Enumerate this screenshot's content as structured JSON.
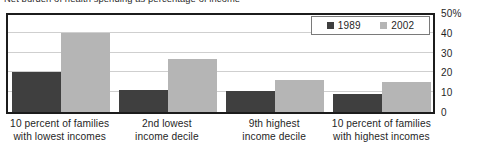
{
  "chart_data": {
    "type": "bar",
    "title": "Net burden of health spending as percentage of income",
    "xlabel": "",
    "ylabel": "",
    "ylim": [
      0,
      50
    ],
    "yticks": [
      0,
      10,
      20,
      30,
      40,
      50
    ],
    "ytick_labels": [
      "0",
      "10",
      "20",
      "30",
      "40",
      "50%"
    ],
    "grid": true,
    "legend_position": "top-right",
    "categories": [
      "10 percent of families with lowest incomes",
      "2nd lowest income decile",
      "9th highest income decile",
      "10 percent of families with highest incomes"
    ],
    "category_lines": [
      [
        "10 percent of families",
        "with lowest incomes"
      ],
      [
        "2nd lowest",
        "income decile"
      ],
      [
        "9th highest",
        "income decile"
      ],
      [
        "10 percent of families",
        "with highest incomes"
      ]
    ],
    "series": [
      {
        "name": "1989",
        "color": "#3f3f3f",
        "values": [
          20,
          11,
          10.5,
          9
        ]
      },
      {
        "name": "2002",
        "color": "#b5b5b5",
        "values": [
          40,
          27,
          16,
          15
        ]
      }
    ]
  },
  "colors": {
    "series_1989": "#3f3f3f",
    "series_2002": "#b5b5b5",
    "frame": "#1c1c1c",
    "gridline": "#cfcfcf",
    "background": "#ffffff"
  }
}
